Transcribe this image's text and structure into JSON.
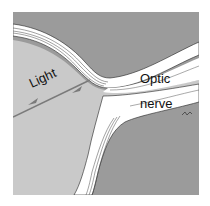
{
  "diagram": {
    "labels": {
      "light": "Light",
      "optic": "Optic",
      "nerve": "nerve"
    },
    "colors": {
      "background": "#ffffff",
      "outer_tissue": "#9b9b9b",
      "eye_interior": "#c9c9c9",
      "retina_layer": "#ffffff",
      "arrow": "#7a7a7a",
      "outline": "#222222"
    }
  }
}
